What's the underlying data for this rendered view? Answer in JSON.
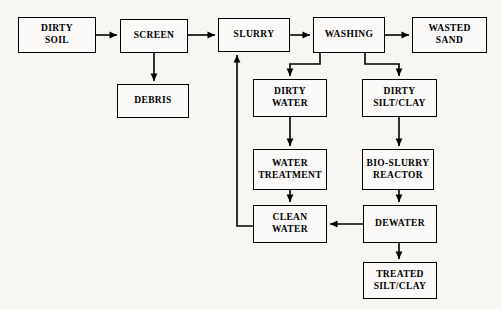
{
  "diagram": {
    "type": "process-flow-diagram",
    "background_color": "#f7f6f3",
    "line_color": "#000000",
    "box_fill": "#fbfaf8",
    "nodes": [
      {
        "id": "dirty-soil",
        "label": "DIRTY\nSOIL",
        "x": 18,
        "y": 17,
        "w": 78,
        "h": 36
      },
      {
        "id": "screen",
        "label": "SCREEN",
        "x": 120,
        "y": 19,
        "w": 68,
        "h": 34
      },
      {
        "id": "debris",
        "label": "DEBRIS",
        "x": 117,
        "y": 84,
        "w": 72,
        "h": 34
      },
      {
        "id": "slurry",
        "label": "SLURRY",
        "x": 218,
        "y": 18,
        "w": 72,
        "h": 34
      },
      {
        "id": "washing",
        "label": "WASHING",
        "x": 313,
        "y": 17,
        "w": 72,
        "h": 36
      },
      {
        "id": "wasted-sand",
        "label": "WASTED\nSAND",
        "x": 412,
        "y": 17,
        "w": 75,
        "h": 36
      },
      {
        "id": "dirty-water",
        "label": "DIRTY\nWATER",
        "x": 253,
        "y": 79,
        "w": 74,
        "h": 38
      },
      {
        "id": "dirty-silt-clay",
        "label": "DIRTY\nSILT/CLAY",
        "x": 362,
        "y": 79,
        "w": 75,
        "h": 38
      },
      {
        "id": "water-treatment",
        "label": "WATER\nTREATMENT",
        "x": 253,
        "y": 149,
        "w": 74,
        "h": 41
      },
      {
        "id": "bio-slurry-reactor",
        "label": "BIO-SLURRY\nREACTOR",
        "x": 362,
        "y": 149,
        "w": 72,
        "h": 41
      },
      {
        "id": "clean-water",
        "label": "CLEAN\nWATER",
        "x": 253,
        "y": 205,
        "w": 74,
        "h": 38
      },
      {
        "id": "dewater",
        "label": "DEWATER",
        "x": 363,
        "y": 205,
        "w": 74,
        "h": 38
      },
      {
        "id": "treated-silt-clay",
        "label": "TREATED\nSILT/CLAY",
        "x": 363,
        "y": 262,
        "w": 74,
        "h": 37
      }
    ],
    "edges": [
      {
        "id": "edge-dirty-soil-screen",
        "from": "dirty-soil",
        "to": "screen",
        "points": "96,35 117,35",
        "arrow": true
      },
      {
        "id": "edge-screen-debris",
        "from": "screen",
        "to": "debris",
        "points": "154,53 154,81",
        "arrow": true
      },
      {
        "id": "edge-screen-slurry",
        "from": "screen",
        "to": "slurry",
        "points": "188,35 215,35",
        "arrow": true
      },
      {
        "id": "edge-slurry-washing",
        "from": "slurry",
        "to": "washing",
        "points": "290,35 310,35",
        "arrow": true
      },
      {
        "id": "edge-washing-wasted-sand",
        "from": "washing",
        "to": "wasted-sand",
        "points": "385,35 409,35",
        "arrow": true
      },
      {
        "id": "edge-washing-dirty-water",
        "from": "washing",
        "to": "dirty-water",
        "points": "320,53 320,64 290,64 290,76",
        "arrow": true
      },
      {
        "id": "edge-washing-dirty-silt-clay",
        "from": "washing",
        "to": "dirty-silt-clay",
        "points": "365,53 365,64 399,64 399,76",
        "arrow": true
      },
      {
        "id": "edge-dirty-water-water-treatment",
        "from": "dirty-water",
        "to": "water-treatment",
        "points": "290,117 290,146",
        "arrow": true
      },
      {
        "id": "edge-dirty-silt-clay-bio-reactor",
        "from": "dirty-silt-clay",
        "to": "bio-slurry-reactor",
        "points": "399,117 399,146",
        "arrow": true
      },
      {
        "id": "edge-water-treatment-clean-water",
        "from": "water-treatment",
        "to": "clean-water",
        "points": "290,190 290,202",
        "arrow": true
      },
      {
        "id": "edge-bio-reactor-dewater",
        "from": "bio-slurry-reactor",
        "to": "dewater",
        "points": "399,190 399,202",
        "arrow": true
      },
      {
        "id": "edge-dewater-clean-water",
        "from": "dewater",
        "to": "clean-water",
        "points": "363,224 330,224",
        "arrow": true
      },
      {
        "id": "edge-dewater-treated-silt-clay",
        "from": "dewater",
        "to": "treated-silt-clay",
        "points": "399,243 399,259",
        "arrow": true
      },
      {
        "id": "edge-clean-water-slurry-recycle",
        "from": "clean-water",
        "to": "slurry",
        "points": "253,226 237,226 237,55",
        "arrow": true
      }
    ]
  }
}
